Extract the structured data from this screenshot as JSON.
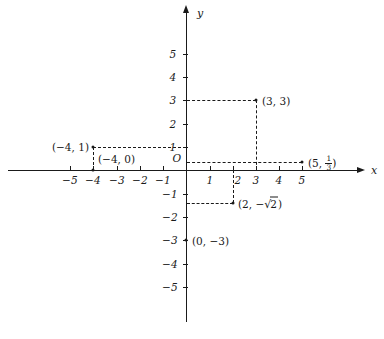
{
  "figure": {
    "type": "cartesian-coordinate-plane",
    "axes": {
      "x_label": "x",
      "y_label": "y",
      "origin_label": "O",
      "x_ticks": [
        "-5",
        "-4",
        "-3",
        "-2",
        "-1",
        "1",
        "2",
        "3",
        "4",
        "5"
      ],
      "y_ticks": [
        "5",
        "4",
        "3",
        "2",
        "1",
        "-1",
        "-2",
        "-3",
        "-4",
        "-5"
      ],
      "xlim": [
        -7.7,
        8.2
      ],
      "ylim": [
        -6.9,
        6.9
      ]
    },
    "points": [
      {
        "name": "point-3-3",
        "x": 3,
        "y": 3,
        "label": "(3, 3)",
        "label_side": "right"
      },
      {
        "name": "point-5-onethird",
        "x": 5,
        "y": 0.3333,
        "label": "(5, 1/3)",
        "label_side": "right"
      },
      {
        "name": "point-neg4-1",
        "x": -4,
        "y": 1,
        "label": "(-4, 1)",
        "label_side": "left"
      },
      {
        "name": "point-neg4-0",
        "x": -4,
        "y": 0,
        "label": "(-4, 0)",
        "label_side": "right"
      },
      {
        "name": "point-2-negsqrt2",
        "x": 2,
        "y": -1.4142,
        "label": "(2, -√2)",
        "label_side": "right"
      },
      {
        "name": "point-0-neg3",
        "x": 0,
        "y": -3,
        "label": "(0, -3)",
        "label_side": "right"
      }
    ],
    "guides": [
      {
        "name": "guide-y3-horizontal",
        "from": [
          0,
          3
        ],
        "to": [
          3,
          3
        ]
      },
      {
        "name": "guide-x3-vertical",
        "from": [
          3,
          3
        ],
        "to": [
          3,
          0
        ]
      },
      {
        "name": "guide-y1-horizontal",
        "from": [
          -4,
          1
        ],
        "to": [
          0,
          1
        ]
      },
      {
        "name": "guide-xneg4-vertical",
        "from": [
          -4,
          1
        ],
        "to": [
          -4,
          0
        ]
      },
      {
        "name": "guide-third-horizontal",
        "from": [
          0,
          0.3333
        ],
        "to": [
          5,
          0.3333
        ]
      },
      {
        "name": "guide-x2-vertical",
        "from": [
          2,
          0
        ],
        "to": [
          2,
          -1.4142
        ]
      },
      {
        "name": "guide-sqrt2-horizontal",
        "from": [
          0,
          -1.4142
        ],
        "to": [
          2,
          -1.4142
        ]
      }
    ],
    "colors": {
      "ink": "#1a1a1a",
      "background": "#ffffff"
    }
  }
}
